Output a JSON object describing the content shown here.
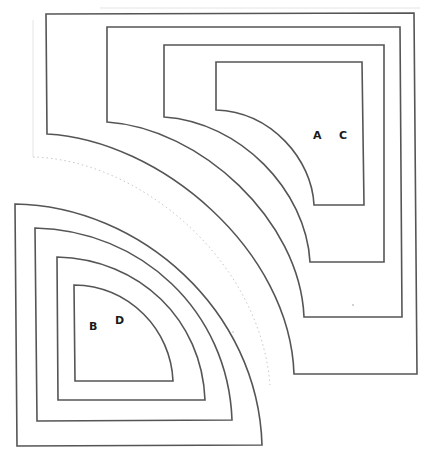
{
  "diagram": {
    "stroke_color": "#555555",
    "upper_right_group": {
      "shape_count": 4,
      "labels": [
        "A",
        "C"
      ]
    },
    "lower_left_group": {
      "shape_count": 4,
      "labels": [
        "B",
        "D"
      ]
    },
    "labels": {
      "a": "A",
      "b": "B",
      "c": "C",
      "d": "D"
    }
  }
}
